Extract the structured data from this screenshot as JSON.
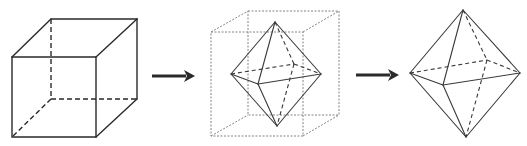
{
  "diagram": {
    "colors": {
      "line": "#2a2a2a",
      "guide": "#777777",
      "background": "#ffffff"
    },
    "figures": [
      {
        "id": "cube",
        "label": "cube",
        "vertices": {
          "ftl": [
            12,
            57
          ],
          "ftr": [
            96,
            57
          ],
          "fbl": [
            12,
            137
          ],
          "fbr": [
            96,
            137
          ],
          "btl": [
            51,
            19
          ],
          "btr": [
            137,
            19
          ],
          "bbl": [
            51,
            99
          ],
          "bbr": [
            137,
            99
          ]
        },
        "hidden_edges": [
          "btl-bbl",
          "bbl-bbr",
          "bbl-fbl"
        ]
      },
      {
        "id": "arrow-1",
        "label": "arrow",
        "from": [
          152,
          76
        ],
        "to": [
          194,
          76
        ]
      },
      {
        "id": "inscribed-octahedron",
        "label": "octahedron inside dotted cube",
        "guide_cube": {
          "ftl": [
            211,
            32
          ],
          "ftr": [
            303,
            32
          ],
          "fbl": [
            211,
            136
          ],
          "fbr": [
            303,
            136
          ],
          "btl": [
            248,
            11
          ],
          "btr": [
            339,
            11
          ],
          "bbl": [
            248,
            115
          ],
          "bbr": [
            339,
            115
          ]
        },
        "vertices": {
          "top": [
            275,
            22
          ],
          "left": [
            231,
            74
          ],
          "right": [
            321,
            74
          ],
          "front": [
            258,
            84
          ],
          "back": [
            294,
            64
          ],
          "bottom": [
            277,
            126
          ]
        },
        "hidden_edges": [
          "top-back",
          "left-back",
          "back-right",
          "back-bottom"
        ]
      },
      {
        "id": "arrow-2",
        "label": "arrow",
        "from": [
          356,
          75
        ],
        "to": [
          398,
          75
        ]
      },
      {
        "id": "octahedron",
        "label": "octahedron",
        "vertices": {
          "top": [
            463,
            10
          ],
          "left": [
            410,
            73
          ],
          "right": [
            520,
            73
          ],
          "front": [
            443,
            85
          ],
          "back": [
            487,
            60
          ],
          "bottom": [
            466,
            137
          ]
        },
        "hidden_edges": [
          "top-back",
          "left-back",
          "back-right",
          "back-bottom"
        ]
      }
    ]
  }
}
